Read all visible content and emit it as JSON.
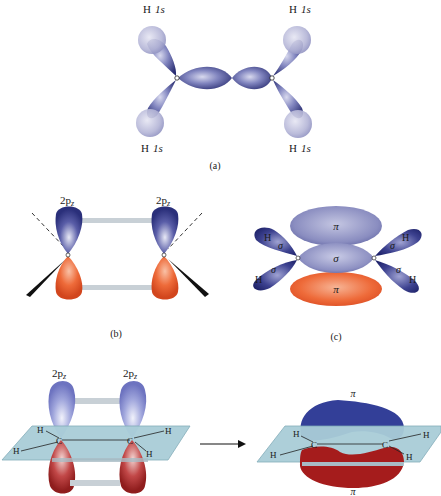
{
  "panels": {
    "a": {
      "caption": "(a)",
      "h_labels": [
        {
          "atom": "H",
          "orbital": "1s"
        },
        {
          "atom": "H",
          "orbital": "1s"
        },
        {
          "atom": "H",
          "orbital": "1s"
        },
        {
          "atom": "H",
          "orbital": "1s"
        }
      ],
      "carbon_label": "C"
    },
    "b": {
      "caption": "(b)",
      "orbital_labels": [
        {
          "base": "2p",
          "sub": "z"
        },
        {
          "base": "2p",
          "sub": "z"
        }
      ],
      "carbon_label": "C"
    },
    "c": {
      "caption": "(c)",
      "pi_top": "π",
      "pi_bottom": "π",
      "sigma_center": "σ",
      "sigma_bonds": [
        "σ",
        "σ",
        "σ",
        "σ"
      ],
      "h_labels": [
        "H",
        "H",
        "H",
        "H"
      ],
      "carbon_label": "C"
    },
    "d": {
      "orbital_labels": [
        {
          "base": "2p",
          "sub": "z"
        },
        {
          "base": "2p",
          "sub": "z"
        }
      ],
      "h_labels": [
        "H",
        "H",
        "H",
        "H"
      ],
      "carbon_labels": [
        "C",
        "C"
      ]
    },
    "e": {
      "pi_top": "π",
      "pi_bottom": "π",
      "h_labels": [
        "H",
        "H",
        "H",
        "H"
      ],
      "carbon_labels": [
        "C",
        "C"
      ]
    }
  },
  "colors": {
    "sigma_lobe": "#3b3f86",
    "sigma_light": "#9ea2cf",
    "h_sphere": "#b9bad8",
    "pi_blue": "#333f98",
    "pi_orange": "#e5552a",
    "pi_red": "#a51c1c",
    "plane": "#a9cdd8",
    "overlap_bar": "#c8d0d6"
  }
}
